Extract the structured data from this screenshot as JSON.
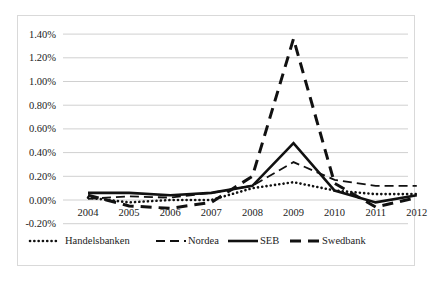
{
  "chart_data": {
    "type": "line",
    "title": "",
    "xlabel": "",
    "ylabel": "",
    "x": [
      "2004",
      "2005",
      "2006",
      "2007",
      "2008",
      "2009",
      "2010",
      "2011",
      "2012"
    ],
    "y_ticks": [
      "1.40%",
      "1.20%",
      "1.00%",
      "0.80%",
      "0.60%",
      "0.40%",
      "0.20%",
      "0.00%",
      "-0.20%"
    ],
    "ylim": [
      -0.2,
      1.4
    ],
    "grid": true,
    "legend_position": "bottom",
    "series": [
      {
        "name": "Handelsbanken",
        "style": "dotted",
        "values": [
          0.02,
          -0.02,
          0.0,
          0.0,
          0.1,
          0.15,
          0.08,
          0.05,
          0.05
        ]
      },
      {
        "name": "Nordea",
        "style": "dashed",
        "values": [
          0.01,
          0.03,
          0.02,
          0.06,
          0.12,
          0.32,
          0.17,
          0.12,
          0.12
        ]
      },
      {
        "name": "SEB",
        "style": "solid",
        "values": [
          0.06,
          0.06,
          0.04,
          0.06,
          0.12,
          0.48,
          0.08,
          -0.02,
          0.04
        ]
      },
      {
        "name": "Swedbank",
        "style": "long-dash",
        "values": [
          0.04,
          -0.05,
          -0.07,
          -0.02,
          0.2,
          1.36,
          0.14,
          -0.06,
          0.02
        ]
      }
    ]
  }
}
